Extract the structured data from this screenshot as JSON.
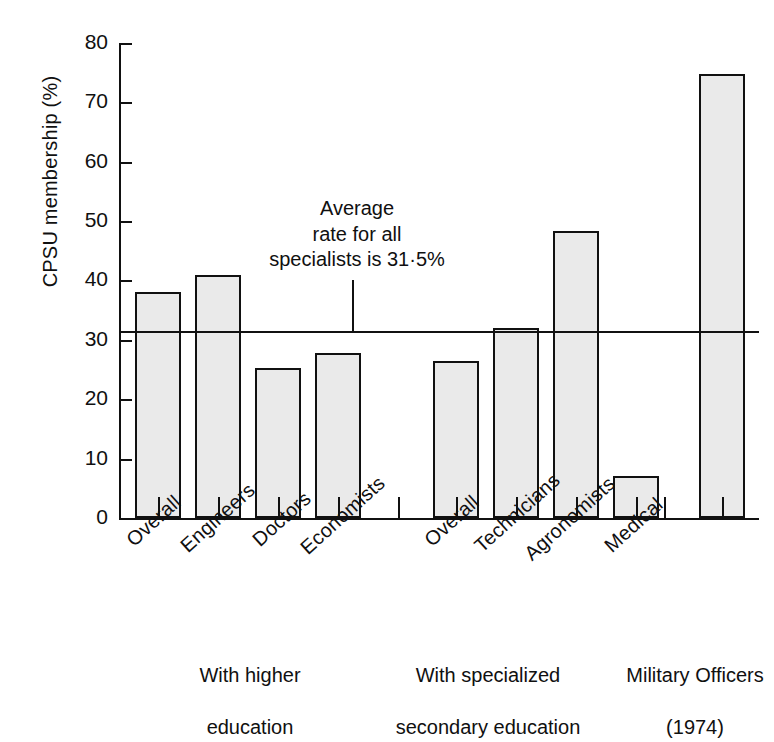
{
  "chart_data": {
    "type": "bar",
    "title": "",
    "xlabel": "",
    "ylabel": "CPSU membership (%)",
    "ylim": [
      0,
      80
    ],
    "ytick_values": [
      0,
      10,
      20,
      30,
      40,
      50,
      60,
      70,
      80
    ],
    "ytick_labels": [
      "0",
      "10",
      "20",
      "30",
      "40",
      "50",
      "60",
      "70",
      "80"
    ],
    "grid": false,
    "legend": "none",
    "categories": [
      "Overall",
      "Engineers",
      "Doctors",
      "Economists",
      "Overall",
      "Technicians",
      "Agronomists",
      "Medical",
      "Military Officers"
    ],
    "values": [
      38.0,
      41.0,
      25.3,
      27.8,
      26.5,
      32.0,
      48.3,
      7.0,
      74.8
    ],
    "series": [
      {
        "name": "CPSU membership",
        "values": [
          38.0,
          41.0,
          25.3,
          27.8,
          26.5,
          32.0,
          48.3,
          7.0,
          74.8
        ]
      }
    ],
    "groups": [
      {
        "caption": "With higher\neducation",
        "categories": [
          "Overall",
          "Engineers",
          "Doctors",
          "Economists"
        ]
      },
      {
        "caption": "With specialized\nsecondary education",
        "categories": [
          "Overall",
          "Technicians",
          "Agronomists",
          "Medical"
        ]
      },
      {
        "caption": "Military Officers\n(1974)",
        "categories": [
          "Military Officers"
        ]
      }
    ],
    "reference_line": {
      "value": 31.5,
      "label": "Average\nrate for all\nspecialists is 31·5%",
      "label_line1": "Average",
      "label_line2": "rate for all",
      "label_line3": "specialists is 31·5%"
    },
    "colors": {
      "bar_fill": "#eaeaea",
      "bar_edge": "#111111",
      "axis": "#111111",
      "text": "#101010",
      "background": "#ffffff"
    }
  },
  "ticks": {
    "t0": "0",
    "t10": "10",
    "t20": "20",
    "t30": "30",
    "t40": "40",
    "t50": "50",
    "t60": "60",
    "t70": "70",
    "t80": "80"
  },
  "axis": {
    "y_title": "CPSU membership (%)"
  },
  "bars": [
    {
      "label": "Overall",
      "value": 38.0
    },
    {
      "label": "Engineers",
      "value": 41.0
    },
    {
      "label": "Doctors",
      "value": 25.3
    },
    {
      "label": "Economists",
      "value": 27.8
    },
    {
      "label": "Overall",
      "value": 26.5
    },
    {
      "label": "Technicians",
      "value": 32.0
    },
    {
      "label": "Agronomists",
      "value": 48.3
    },
    {
      "label": "Medical",
      "value": 7.0
    },
    {
      "label": "Military Officers",
      "value": 74.8
    }
  ],
  "captions": {
    "group1_line1": "With higher",
    "group1_line2": "education",
    "group2_line1": "With specialized",
    "group2_line2": "secondary education",
    "group3_line1": "Military Officers",
    "group3_line2": "(1974)"
  },
  "annotation": {
    "line1": "Average",
    "line2": "rate for all",
    "line3": "specialists is 31·5%"
  }
}
